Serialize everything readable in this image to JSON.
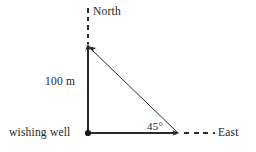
{
  "diagram": {
    "background_color": "#ffffff",
    "stroke_color": "#2a2a2a",
    "labels": {
      "north": "North",
      "east": "East",
      "distance": "100 m",
      "origin": "wishing well",
      "angle": "45°"
    },
    "points": {
      "origin": {
        "x": 88,
        "y": 133,
        "name": "wishing well"
      },
      "apex": {
        "x": 88,
        "y": 46,
        "name": "north point"
      },
      "east_point": {
        "x": 178,
        "y": 133,
        "name": "east point"
      }
    },
    "segments": [
      {
        "name": "north-dashed-guide",
        "style": "dashed",
        "from": [
          88,
          8
        ],
        "to": [
          88,
          44
        ]
      },
      {
        "name": "vertical-leg",
        "style": "solid",
        "from": [
          88,
          46
        ],
        "to": [
          88,
          133
        ],
        "length_label": "100 m"
      },
      {
        "name": "horizontal-leg",
        "style": "solid",
        "from": [
          88,
          133
        ],
        "to": [
          178,
          133
        ]
      },
      {
        "name": "east-dashed-guide",
        "style": "dashed",
        "from": [
          184,
          133
        ],
        "to": [
          215,
          133
        ]
      },
      {
        "name": "hypotenuse",
        "style": "solid",
        "from": [
          178,
          133
        ],
        "to": [
          88,
          46
        ]
      }
    ],
    "angles": [
      {
        "name": "angle-at-east-point",
        "value": "45°",
        "vertex": [
          178,
          133
        ]
      }
    ]
  }
}
